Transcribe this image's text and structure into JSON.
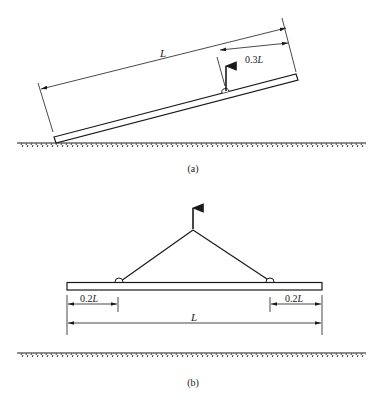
{
  "figure_a": {
    "caption": "(a)",
    "dim_total": {
      "num": "",
      "var": "L"
    },
    "dim_lift": {
      "num": "0.3",
      "var": "L"
    }
  },
  "figure_b": {
    "caption": "(b)",
    "dim_left": {
      "num": "0.2",
      "var": "L"
    },
    "dim_right": {
      "num": "0.2",
      "var": "L"
    },
    "dim_total": {
      "num": "",
      "var": "L"
    }
  },
  "colors": {
    "ink": "#1a1a1a",
    "background": "#ffffff"
  }
}
